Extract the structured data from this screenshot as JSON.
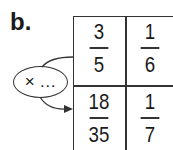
{
  "label": "b.",
  "table": {
    "cells": [
      {
        "num": "3",
        "den": "5"
      },
      {
        "num": "1",
        "den": "6"
      },
      {
        "num": "18",
        "den": "35"
      },
      {
        "num": "1",
        "den": "7"
      }
    ]
  },
  "operator": {
    "text": "× …"
  }
}
